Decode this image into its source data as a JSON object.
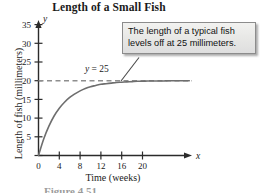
{
  "chart_data": {
    "type": "line",
    "title": "Length of a Small Fish",
    "xlabel": "Time (weeks)",
    "ylabel": "Length of fish (millimeters)",
    "xlim": [
      0,
      29
    ],
    "ylim": [
      0,
      38
    ],
    "xticks": [
      "0",
      "4",
      "8",
      "12",
      "16",
      "20"
    ],
    "xtick_values": [
      0,
      4,
      8,
      12,
      16,
      20
    ],
    "yticks": [
      "5",
      "10",
      "15",
      "20",
      "25",
      "30",
      "35"
    ],
    "ytick_values": [
      5,
      10,
      15,
      20,
      25,
      30,
      35
    ],
    "grid": false,
    "legend": "none",
    "x_axis_variable": "x",
    "y_axis_variable": "y",
    "series": [
      {
        "name": "Length of fish",
        "kind": "curve",
        "equation": "y = 25(1 - e^(-0.25x))",
        "color": "#6e6e6e",
        "x": [
          0,
          1,
          2,
          3,
          4,
          5,
          6,
          7,
          8,
          9,
          10,
          11,
          12,
          13,
          14,
          15,
          16,
          17,
          18,
          19,
          20,
          21,
          22,
          23,
          24,
          25,
          26,
          27,
          28,
          29
        ],
        "values": [
          0.0,
          5.5,
          9.8,
          13.2,
          15.8,
          17.8,
          19.4,
          20.6,
          21.6,
          22.4,
          23.0,
          23.4,
          23.8,
          24.0,
          24.2,
          24.4,
          24.5,
          24.6,
          24.7,
          24.8,
          24.8,
          24.9,
          24.9,
          24.9,
          24.9,
          25.0,
          25.0,
          25.0,
          25.0,
          25.0
        ]
      }
    ],
    "asymptote": {
      "name": "horizontal-asymptote",
      "label": "y = 25",
      "label_prefix": "y",
      "label_suffix": " = 25",
      "value": 25,
      "style": "dashed",
      "color": "#8e8e8e"
    },
    "annotations": [
      {
        "name": "callout",
        "text": "The length of a typical fish levels off at 25 millimeters.",
        "points_to_x": 17,
        "points_to_y": 25
      }
    ]
  },
  "figure": {
    "caption": "Figure 4.51"
  },
  "colors": {
    "axis": "#2b2b2b",
    "curve": "#6e6e6e",
    "asymptote": "#8e8e8e",
    "callout_border": "#8c8c8c",
    "text": "#1a1a1a"
  }
}
